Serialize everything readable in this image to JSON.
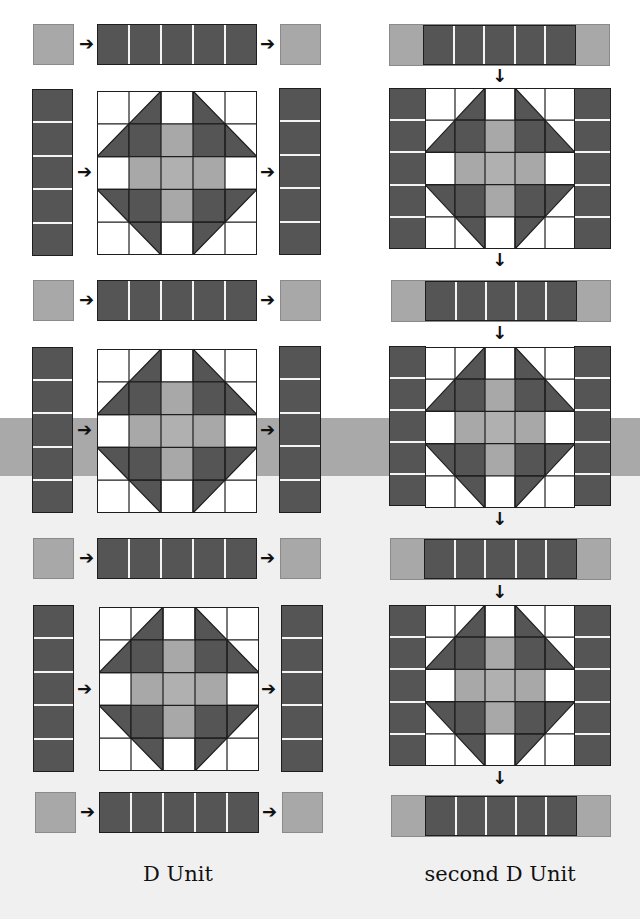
{
  "colors": {
    "dark": "#555555",
    "light": "#a8a8a8",
    "center": "#b0b0b0",
    "white": "#ffffff",
    "outline": "#1e1e1e",
    "band": "#a9a9a9"
  },
  "arrows": {
    "right": "➔",
    "down": "↓"
  },
  "block_pattern": {
    "grid_size": 5,
    "rows": [
      [
        "white",
        "tri-br",
        "white",
        "tri-bl",
        "white"
      ],
      [
        "tri-br",
        "dark",
        "light",
        "dark",
        "tri-bl"
      ],
      [
        "white",
        "light",
        "center",
        "light",
        "white"
      ],
      [
        "tri-tr",
        "dark",
        "light",
        "dark",
        "tri-tl"
      ],
      [
        "white",
        "tri-tr",
        "white",
        "tri-tl",
        "white"
      ]
    ]
  },
  "left_column": {
    "label": "D Unit",
    "rows": [
      {
        "type": "strip-row",
        "segments": 5
      },
      {
        "type": "block-row",
        "side_segments": 5
      },
      {
        "type": "strip-row",
        "segments": 5
      },
      {
        "type": "block-row",
        "side_segments": 5
      },
      {
        "type": "strip-row",
        "segments": 5
      },
      {
        "type": "block-row",
        "side_segments": 5
      },
      {
        "type": "strip-row",
        "segments": 5
      }
    ]
  },
  "right_column": {
    "label": "second D Unit",
    "rows": [
      {
        "type": "composite-strip",
        "segments": 5
      },
      {
        "type": "composite-block",
        "side_segments": 5
      },
      {
        "type": "composite-strip",
        "segments": 5
      },
      {
        "type": "composite-block",
        "side_segments": 5
      },
      {
        "type": "composite-strip",
        "segments": 5
      },
      {
        "type": "composite-block",
        "side_segments": 5
      },
      {
        "type": "composite-strip",
        "segments": 5
      }
    ]
  }
}
